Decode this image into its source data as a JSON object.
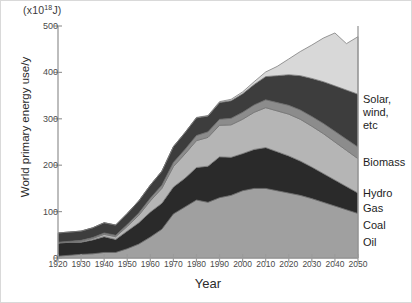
{
  "figure": {
    "units_prefix": "(x10",
    "units_exponent": "18",
    "units_suffix": "J)",
    "y_axis_title": "World primary energy use/y",
    "x_axis_title": "Year",
    "frame_color": "#d9d9d9",
    "axis_color": "#9a9a9a"
  },
  "legend": {
    "solar": "Solar,\nwind,\netc",
    "biomass": "Biomass",
    "hydro": "Hydro",
    "gas": "Gas",
    "coal": "Coal",
    "oil": "Oil"
  },
  "chart_data": {
    "type": "area",
    "title": "",
    "subtitle": "",
    "xlabel": "Year",
    "ylabel": "World primary energy use/y",
    "units": "(x10^18 J)",
    "stacked": true,
    "grid": false,
    "legend_position": "right",
    "xlim": [
      1920,
      2050
    ],
    "ylim": [
      0,
      500
    ],
    "yticks": [
      0,
      100,
      200,
      300,
      400,
      500
    ],
    "xticks": [
      1920,
      1930,
      1940,
      1950,
      1960,
      1970,
      1980,
      1990,
      2000,
      2010,
      2020,
      2030,
      2040,
      2050
    ],
    "x": [
      1920,
      1925,
      1930,
      1935,
      1940,
      1945,
      1950,
      1955,
      1960,
      1965,
      1970,
      1975,
      1980,
      1985,
      1990,
      1995,
      2000,
      2005,
      2010,
      2015,
      2020,
      2025,
      2030,
      2035,
      2040,
      2045,
      2050
    ],
    "series": [
      {
        "name": "Oil",
        "color": "#a0a0a0",
        "values": [
          4,
          6,
          8,
          9,
          12,
          12,
          20,
          30,
          45,
          62,
          95,
          110,
          125,
          120,
          130,
          135,
          145,
          150,
          150,
          145,
          140,
          135,
          128,
          120,
          112,
          104,
          96
        ]
      },
      {
        "name": "Coal",
        "color": "#2a2a2a",
        "values": [
          28,
          28,
          26,
          30,
          34,
          28,
          38,
          46,
          54,
          56,
          58,
          62,
          70,
          78,
          88,
          82,
          80,
          84,
          88,
          84,
          80,
          74,
          68,
          62,
          56,
          50,
          44
        ]
      },
      {
        "name": "Gas",
        "color": "#b5b5b5",
        "values": [
          1,
          1,
          2,
          3,
          5,
          6,
          10,
          16,
          24,
          32,
          44,
          52,
          58,
          62,
          68,
          70,
          74,
          80,
          86,
          88,
          90,
          90,
          88,
          86,
          82,
          78,
          74
        ]
      },
      {
        "name": "Hydro",
        "color": "#8c8c8c",
        "values": [
          1,
          1,
          2,
          2,
          3,
          3,
          4,
          5,
          6,
          7,
          9,
          10,
          11,
          12,
          13,
          14,
          15,
          16,
          17,
          18,
          19,
          20,
          21,
          22,
          23,
          24,
          25
        ]
      },
      {
        "name": "Biomass",
        "color": "#3d3d3d",
        "values": [
          20,
          20,
          20,
          21,
          22,
          22,
          24,
          26,
          28,
          30,
          34,
          36,
          38,
          34,
          36,
          38,
          40,
          44,
          50,
          58,
          66,
          74,
          82,
          90,
          98,
          106,
          114
        ]
      },
      {
        "name": "Solar, wind, etc",
        "color": "#d8d8d8",
        "values": [
          0,
          0,
          0,
          0,
          0,
          0,
          0,
          0,
          0,
          0,
          0,
          0,
          1,
          1,
          2,
          3,
          4,
          6,
          10,
          20,
          34,
          52,
          72,
          94,
          114,
          100,
          124
        ]
      }
    ],
    "total_values": [
      54,
      56,
      58,
      65,
      76,
      71,
      96,
      123,
      157,
      187,
      240,
      270,
      303,
      307,
      337,
      342,
      358,
      380,
      401,
      413,
      429,
      445,
      459,
      474,
      485,
      462,
      477
    ]
  }
}
